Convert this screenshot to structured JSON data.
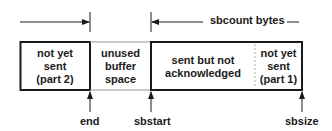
{
  "diagram": {
    "type": "circular send buffer layout",
    "colors": {
      "line": "#1a1a1a",
      "thin_border": "#9a9a9a",
      "dotted": "#b0b0b0",
      "background": "#ffffff"
    },
    "segments": [
      {
        "id": "not-yet-sent-part2",
        "lines": [
          "not yet",
          "sent",
          "(part 2)"
        ]
      },
      {
        "id": "unused-buffer-space",
        "lines": [
          "unused",
          "buffer",
          "space"
        ]
      },
      {
        "id": "sent-not-acknowledged",
        "lines": [
          "sent but not",
          "acknowledged"
        ]
      },
      {
        "id": "not-yet-sent-part1",
        "lines": [
          "not yet",
          "sent",
          "(part 1)"
        ]
      }
    ],
    "top_label": "sbcount bytes",
    "pointers": [
      {
        "id": "end",
        "label": "end"
      },
      {
        "id": "sbstart",
        "label": "sbstart"
      },
      {
        "id": "sbsize",
        "label": "sbsize"
      }
    ]
  }
}
